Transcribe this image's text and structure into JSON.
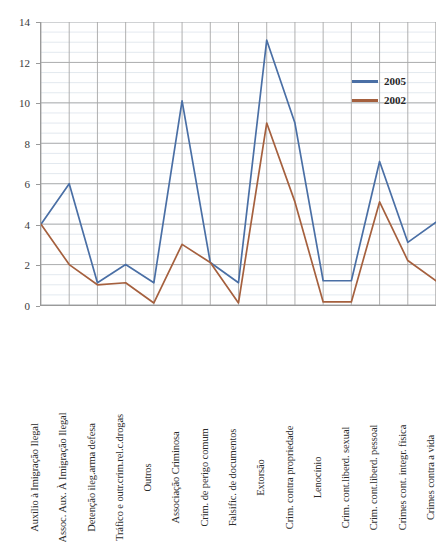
{
  "chart_data": {
    "type": "line",
    "title": "",
    "xlabel": "",
    "ylabel": "",
    "ylim": [
      0,
      14
    ],
    "y_ticks": [
      0,
      2,
      4,
      6,
      8,
      10,
      12,
      14
    ],
    "grid": true,
    "minor_grid": true,
    "legend_position": "top-right",
    "categories": [
      "Auxílio à Imigração Ilegal",
      "Assoc. Aux. À Imigração Ilegal",
      "Detenção ileg.arma defesa",
      "Tráfico e outr.crim.rel.c.drogas",
      "Outros",
      "Associação Criminosa",
      "Crim. de perigo comum",
      "Falsific. de documentos",
      "Extorsão",
      "Crim. contra propriedade",
      "Lenocínio",
      "Crim. cont.liberd. sexual",
      "Crim. cont.liberd. pessoal",
      "Crimes cont. integr. física",
      "Crimes contra a vida"
    ],
    "series": [
      {
        "name": "2005",
        "color": "#4A6FA5",
        "values": [
          4.0,
          6.0,
          1.1,
          2.0,
          1.1,
          10.1,
          2.1,
          1.1,
          13.1,
          9.0,
          1.2,
          1.2,
          7.1,
          3.1,
          4.1
        ]
      },
      {
        "name": "2002",
        "color": "#A5603E",
        "values": [
          4.0,
          2.0,
          1.0,
          1.1,
          0.1,
          3.0,
          2.1,
          0.1,
          9.0,
          5.1,
          0.15,
          0.15,
          5.1,
          2.2,
          1.2
        ]
      }
    ]
  },
  "legend": {
    "entries": [
      {
        "label": "2005",
        "color": "#4A6FA5"
      },
      {
        "label": "2002",
        "color": "#A5603E"
      }
    ]
  },
  "axes": {
    "y_tick_labels": [
      "0",
      "2",
      "4",
      "6",
      "8",
      "10",
      "12",
      "14"
    ]
  }
}
